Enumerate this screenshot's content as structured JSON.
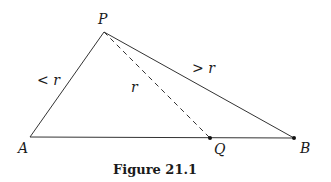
{
  "figure": {
    "caption": "Figure 21.1",
    "points": {
      "P": {
        "label": "P",
        "x": 104,
        "y": 32
      },
      "A": {
        "label": "A",
        "x": 30,
        "y": 137
      },
      "Q": {
        "label": "Q",
        "x": 210,
        "y": 138
      },
      "B": {
        "label": "B",
        "x": 294,
        "y": 138
      }
    },
    "edge_labels": {
      "PA": "< r",
      "PQ": "r",
      "PB": "> r"
    },
    "colors": {
      "line": "#333333",
      "text": "#1a1a1a"
    }
  }
}
